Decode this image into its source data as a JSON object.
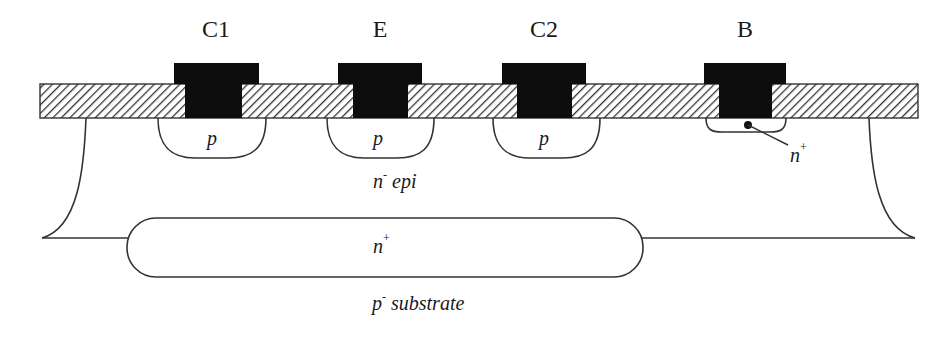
{
  "diagram": {
    "type": "semiconductor cross-section",
    "terminals": [
      {
        "label": "C1",
        "x": 216
      },
      {
        "label": "E",
        "x": 380
      },
      {
        "label": "C2",
        "x": 544
      },
      {
        "label": "B",
        "x": 745
      }
    ],
    "regions": {
      "p_wells": [
        {
          "label": "p",
          "x": 212
        },
        {
          "label": "p",
          "x": 380
        },
        {
          "label": "p",
          "x": 546
        }
      ],
      "base_contact": {
        "label": "n",
        "superscript": "+"
      },
      "epi": {
        "label": "n",
        "superscript": "-",
        "suffix": " epi"
      },
      "buried_layer": {
        "label": "n",
        "superscript": "+"
      },
      "substrate": {
        "label": "p",
        "superscript": "-",
        "suffix": " substrate"
      }
    },
    "colors": {
      "line": "#333333",
      "metal": "#0d0d0d",
      "background": "#ffffff"
    }
  }
}
